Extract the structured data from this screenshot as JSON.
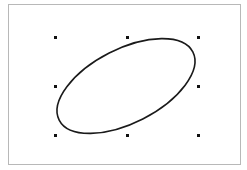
{
  "canvas": {
    "background": "#ffffff",
    "frame_border_color": "#b8b8b8"
  },
  "shape": {
    "type": "ellipse",
    "icon": "ellipse-shape",
    "stroke_color": "#1a1a1a",
    "selected": true
  },
  "selection_handles": {
    "color": "#111111",
    "positions": [
      "top-left",
      "top-center",
      "top-right",
      "middle-left",
      "middle-right",
      "bottom-left",
      "bottom-center",
      "bottom-right"
    ]
  }
}
